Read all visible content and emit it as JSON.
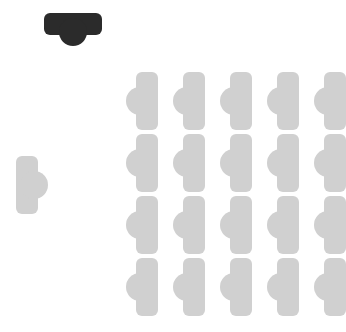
{
  "canvas": {
    "width": 346,
    "height": 332,
    "background_color": "#ffffff"
  },
  "colors": {
    "marker": "#2b2b2b",
    "shape_gray": "#d0d0d0",
    "background": "#ffffff"
  },
  "marker": {
    "name": "rotated-marker-shape",
    "fill": "#2b2b2b",
    "orientation": "horizontal-bar-with-bump-below",
    "rotation_degrees": 90,
    "x": 44,
    "y": 13,
    "width": 58,
    "height": 36
  },
  "sample": {
    "name": "sample-shape",
    "fill": "#d0d0d0",
    "orientation": "vertical-bar-with-bump-right",
    "rotation_degrees": 0,
    "mirrored": false,
    "x": 16,
    "y": 156,
    "width": 32,
    "height": 58
  },
  "grid": {
    "rows": 4,
    "columns": 5,
    "count": 20,
    "origin_x": 126,
    "origin_y": 72,
    "column_spacing": 47,
    "row_spacing": 62,
    "cell_fill": "#d0d0d0",
    "cell_orientation": "vertical-bar-with-bump-left",
    "cells": [
      {
        "row": 1,
        "col": 1,
        "x": 126,
        "y": 72,
        "fill": "#d0d0d0",
        "orientation": "vertical-bar-with-bump-left"
      },
      {
        "row": 1,
        "col": 2,
        "x": 173,
        "y": 72,
        "fill": "#d0d0d0",
        "orientation": "vertical-bar-with-bump-left"
      },
      {
        "row": 1,
        "col": 3,
        "x": 220,
        "y": 72,
        "fill": "#d0d0d0",
        "orientation": "vertical-bar-with-bump-left"
      },
      {
        "row": 1,
        "col": 4,
        "x": 267,
        "y": 72,
        "fill": "#d0d0d0",
        "orientation": "vertical-bar-with-bump-left"
      },
      {
        "row": 1,
        "col": 5,
        "x": 314,
        "y": 72,
        "fill": "#d0d0d0",
        "orientation": "vertical-bar-with-bump-left"
      },
      {
        "row": 2,
        "col": 1,
        "x": 126,
        "y": 134,
        "fill": "#d0d0d0",
        "orientation": "vertical-bar-with-bump-left"
      },
      {
        "row": 2,
        "col": 2,
        "x": 173,
        "y": 134,
        "fill": "#d0d0d0",
        "orientation": "vertical-bar-with-bump-left"
      },
      {
        "row": 2,
        "col": 3,
        "x": 220,
        "y": 134,
        "fill": "#d0d0d0",
        "orientation": "vertical-bar-with-bump-left"
      },
      {
        "row": 2,
        "col": 4,
        "x": 267,
        "y": 134,
        "fill": "#d0d0d0",
        "orientation": "vertical-bar-with-bump-left"
      },
      {
        "row": 2,
        "col": 5,
        "x": 314,
        "y": 134,
        "fill": "#d0d0d0",
        "orientation": "vertical-bar-with-bump-left"
      },
      {
        "row": 3,
        "col": 1,
        "x": 126,
        "y": 196,
        "fill": "#d0d0d0",
        "orientation": "vertical-bar-with-bump-left"
      },
      {
        "row": 3,
        "col": 2,
        "x": 173,
        "y": 196,
        "fill": "#d0d0d0",
        "orientation": "vertical-bar-with-bump-left"
      },
      {
        "row": 3,
        "col": 3,
        "x": 220,
        "y": 196,
        "fill": "#d0d0d0",
        "orientation": "vertical-bar-with-bump-left"
      },
      {
        "row": 3,
        "col": 4,
        "x": 267,
        "y": 196,
        "fill": "#d0d0d0",
        "orientation": "vertical-bar-with-bump-left"
      },
      {
        "row": 3,
        "col": 5,
        "x": 314,
        "y": 196,
        "fill": "#d0d0d0",
        "orientation": "vertical-bar-with-bump-left"
      },
      {
        "row": 4,
        "col": 1,
        "x": 126,
        "y": 258,
        "fill": "#d0d0d0",
        "orientation": "vertical-bar-with-bump-left"
      },
      {
        "row": 4,
        "col": 2,
        "x": 173,
        "y": 258,
        "fill": "#d0d0d0",
        "orientation": "vertical-bar-with-bump-left"
      },
      {
        "row": 4,
        "col": 3,
        "x": 220,
        "y": 258,
        "fill": "#d0d0d0",
        "orientation": "vertical-bar-with-bump-left"
      },
      {
        "row": 4,
        "col": 4,
        "x": 267,
        "y": 258,
        "fill": "#d0d0d0",
        "orientation": "vertical-bar-with-bump-left"
      },
      {
        "row": 4,
        "col": 5,
        "x": 314,
        "y": 258,
        "fill": "#d0d0d0",
        "orientation": "vertical-bar-with-bump-left"
      }
    ]
  }
}
